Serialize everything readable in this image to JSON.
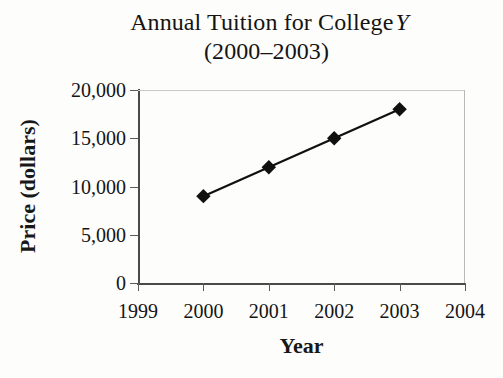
{
  "chart_data": {
    "type": "line",
    "title_main": "Annual Tuition for College",
    "title_italic_token": "Y",
    "subtitle": "(2000–2003)",
    "xlabel": "Year",
    "ylabel": "Price (dollars)",
    "x": [
      2000,
      2001,
      2002,
      2003
    ],
    "values": [
      9000,
      12000,
      15000,
      18000
    ],
    "series": [
      {
        "name": "Annual Tuition",
        "values": [
          9000,
          12000,
          15000,
          18000
        ]
      }
    ],
    "xlim": [
      1999,
      2004
    ],
    "ylim": [
      0,
      20000
    ],
    "xticks": [
      1999,
      2000,
      2001,
      2002,
      2003,
      2004
    ],
    "xtick_labels": [
      "1999",
      "2000",
      "2001",
      "2002",
      "2003",
      "2004"
    ],
    "yticks": [
      0,
      5000,
      10000,
      15000,
      20000
    ],
    "ytick_labels": [
      "0",
      "5,000",
      "10,000",
      "15,000",
      "20,000"
    ],
    "grid": false,
    "legend": "none",
    "marker": "diamond",
    "marker_color": "#101010",
    "line_color": "#101010"
  }
}
